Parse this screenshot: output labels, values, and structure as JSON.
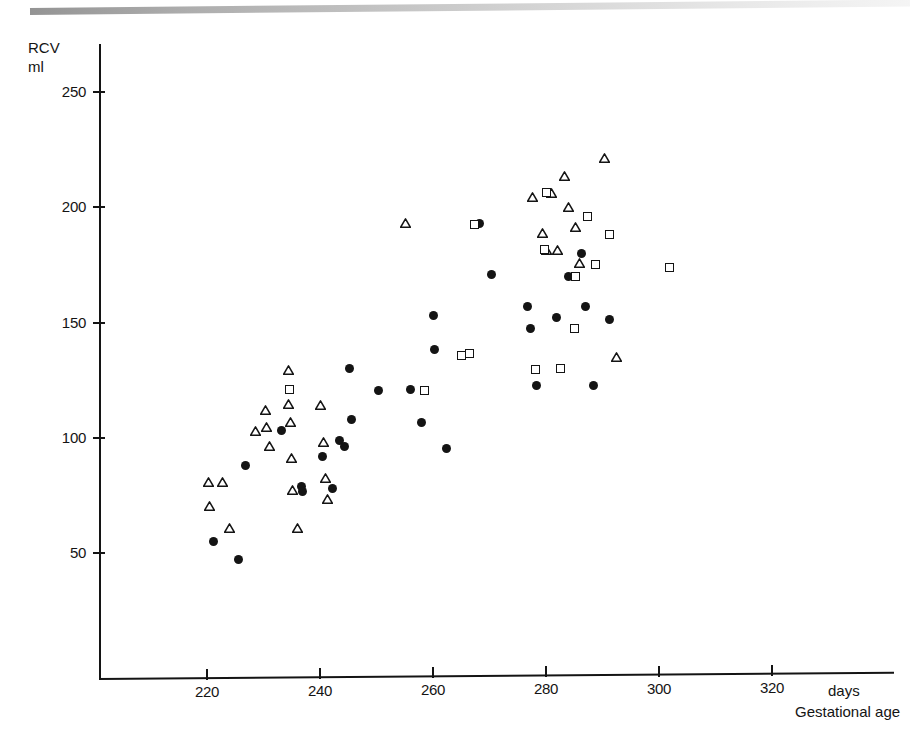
{
  "figure": {
    "type": "scatter",
    "scan_artifact": "gray-scan-bar"
  },
  "axes": {
    "y_title": "RCV\nml",
    "x_unit": "days",
    "x_title": "Gestational age",
    "y_ticks": [
      250,
      200,
      150,
      100,
      50
    ],
    "x_ticks": [
      220,
      240,
      260,
      280,
      300,
      320
    ]
  },
  "chart_data": {
    "type": "scatter",
    "title": "",
    "xlabel": "Gestational age",
    "xunit": "days",
    "ylabel": "RCV",
    "yunit": "ml",
    "xlim": [
      200,
      330
    ],
    "ylim": [
      0,
      260
    ],
    "xticks": [
      220,
      240,
      260,
      280,
      300,
      320
    ],
    "yticks": [
      50,
      100,
      150,
      200,
      250
    ],
    "grid": false,
    "legend": "none",
    "series": [
      {
        "name": "filled-circle",
        "marker": "filled circle",
        "color": "#141414",
        "points": [
          [
            221.1,
            55.0
          ],
          [
            225.5,
            47.0
          ],
          [
            226.9,
            88.0
          ],
          [
            233.1,
            103.0
          ],
          [
            236.8,
            79.0
          ],
          [
            236.9,
            76.5
          ],
          [
            240.5,
            92.0
          ],
          [
            242.2,
            78.0
          ],
          [
            243.5,
            99.0
          ],
          [
            244.3,
            96.0
          ],
          [
            245.3,
            130.0
          ],
          [
            245.6,
            108.0
          ],
          [
            250.4,
            120.5
          ],
          [
            256.0,
            121.0
          ],
          [
            258.0,
            106.5
          ],
          [
            260.0,
            153.0
          ],
          [
            260.3,
            138.5
          ],
          [
            262.4,
            95.5
          ],
          [
            268.3,
            193.0
          ],
          [
            270.3,
            171.0
          ],
          [
            276.8,
            157.0
          ],
          [
            277.2,
            147.5
          ],
          [
            278.4,
            122.5
          ],
          [
            281.8,
            152.0
          ],
          [
            283.9,
            170.0
          ],
          [
            286.3,
            180.0
          ],
          [
            287.0,
            157.0
          ],
          [
            288.4,
            122.5
          ],
          [
            291.2,
            151.5
          ]
        ]
      },
      {
        "name": "open-triangle",
        "marker": "open triangle",
        "color": "#141414",
        "points": [
          [
            220.2,
            81.0
          ],
          [
            220.4,
            70.5
          ],
          [
            222.8,
            81.0
          ],
          [
            224.0,
            61.0
          ],
          [
            228.6,
            103.0
          ],
          [
            230.4,
            112.0
          ],
          [
            230.6,
            104.5
          ],
          [
            231.0,
            96.5
          ],
          [
            234.4,
            129.5
          ],
          [
            234.5,
            114.5
          ],
          [
            234.8,
            107.0
          ],
          [
            235.0,
            91.0
          ],
          [
            235.2,
            77.5
          ],
          [
            236.0,
            61.0
          ],
          [
            240.0,
            114.0
          ],
          [
            240.6,
            98.0
          ],
          [
            241.0,
            82.5
          ],
          [
            241.4,
            73.5
          ],
          [
            255.2,
            193.0
          ],
          [
            277.6,
            204.5
          ],
          [
            279.4,
            189.0
          ],
          [
            280.1,
            181.5
          ],
          [
            281.0,
            206.0
          ],
          [
            282.0,
            181.5
          ],
          [
            283.2,
            213.5
          ],
          [
            284.0,
            200.0
          ],
          [
            285.3,
            191.5
          ],
          [
            286.0,
            176.0
          ],
          [
            290.3,
            221.5
          ],
          [
            292.5,
            135.0
          ]
        ]
      },
      {
        "name": "open-square",
        "marker": "open square",
        "color": "#141414",
        "points": [
          [
            234.6,
            121.0
          ],
          [
            258.5,
            120.5
          ],
          [
            265.1,
            135.5
          ],
          [
            266.5,
            136.5
          ],
          [
            267.3,
            192.5
          ],
          [
            278.2,
            129.5
          ],
          [
            279.7,
            181.5
          ],
          [
            280.0,
            206.5
          ],
          [
            282.6,
            130.0
          ],
          [
            285.1,
            147.5
          ],
          [
            285.3,
            170.0
          ],
          [
            287.4,
            196.0
          ],
          [
            288.7,
            175.0
          ],
          [
            291.3,
            188.0
          ],
          [
            301.8,
            174.0
          ]
        ]
      }
    ]
  }
}
